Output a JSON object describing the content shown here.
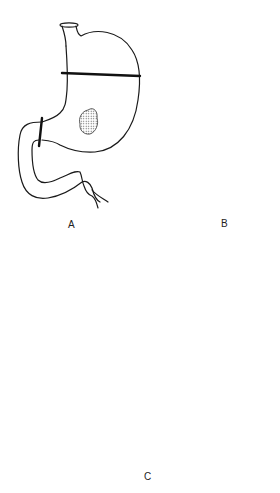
{
  "figure": {
    "panels": [
      {
        "id": "A",
        "label": "A",
        "description": "Stomach with lesion; resection lines across body and at pylorus; duodenum attached"
      },
      {
        "id": "B",
        "label": "B",
        "description": "Resected proximal stomach closed with sutures (open lumen at greater curvature); separated duodenum with open end"
      },
      {
        "id": "C",
        "label": "C",
        "description": "Reconstructed gastric remnant with sutured lesser curvature and end-to-end gastroduodenal anastomosis"
      }
    ],
    "colors": {
      "line": "#1a1a1a",
      "background": "#ffffff",
      "lesion_fill": "#c8c8c8"
    }
  }
}
